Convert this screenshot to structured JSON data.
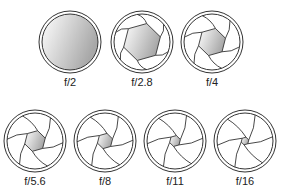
{
  "colors": {
    "stroke": "#333333",
    "fill_light": "#ffffff",
    "fill_dark": "#a8a8a8"
  },
  "apertures": [
    {
      "label": "f/2",
      "opening": 1.0,
      "row": 0,
      "cx": 70,
      "cy": 42
    },
    {
      "label": "f/2.8",
      "opening": 0.68,
      "row": 0,
      "cx": 142,
      "cy": 42
    },
    {
      "label": "f/4",
      "opening": 0.5,
      "row": 0,
      "cx": 212,
      "cy": 42
    },
    {
      "label": "f/5.6",
      "opening": 0.38,
      "row": 1,
      "cx": 35,
      "cy": 141
    },
    {
      "label": "f/8",
      "opening": 0.28,
      "row": 1,
      "cx": 105,
      "cy": 141
    },
    {
      "label": "f/11",
      "opening": 0.2,
      "row": 1,
      "cx": 175,
      "cy": 141
    },
    {
      "label": "f/16",
      "opening": 0.14,
      "row": 1,
      "cx": 245,
      "cy": 141
    }
  ]
}
